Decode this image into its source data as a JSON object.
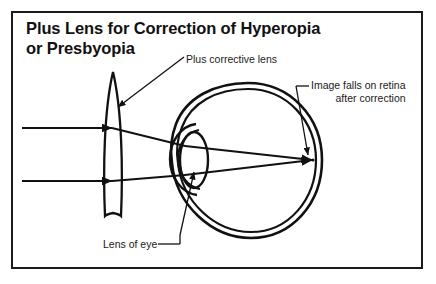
{
  "figure": {
    "title_line1": "Plus Lens for Correction of Hyperopia",
    "title_line2": "or Presbyopia",
    "border_color": "#1a1a1a",
    "background_color": "#ffffff",
    "stroke_color": "#1a1a1a"
  },
  "labels": {
    "corrective_lens": "Plus corrective lens",
    "retina": "Image falls on retina\nafter correction",
    "retina_line1": "Image falls on retina",
    "retina_line2": "after correction",
    "lens_of_eye": "Lens of eye"
  },
  "diagram": {
    "corrective_lens_name": "plus-corrective-lens",
    "eyeball_name": "eyeball",
    "cornea_name": "cornea",
    "eye_lens_name": "lens-of-eye",
    "retina_focus_name": "retina-focal-point",
    "incoming_ray_count": 2,
    "refracted_ray_count": 2
  }
}
